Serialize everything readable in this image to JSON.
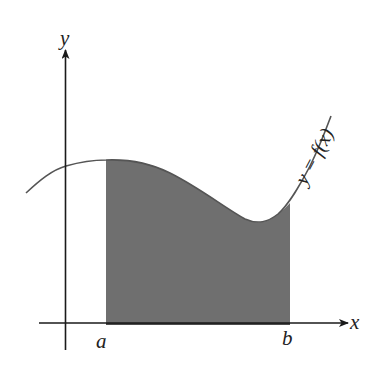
{
  "figure": {
    "axes": {
      "x_label": "x",
      "y_label": "y"
    },
    "bounds": {
      "a_label": "a",
      "b_label": "b"
    },
    "curve_label": "y = f(x)",
    "colors": {
      "shade": "#6f6f6f",
      "curve": "#555555",
      "axis": "#1a1a1a",
      "background": "#ffffff"
    }
  }
}
